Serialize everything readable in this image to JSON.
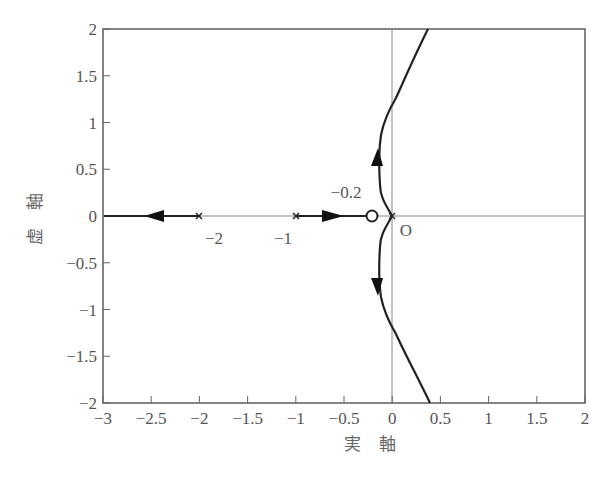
{
  "chart_data": {
    "type": "line",
    "title": "",
    "xlabel": "実 軸",
    "ylabel": "虚 軸",
    "xlim": [
      -3,
      2
    ],
    "ylim": [
      -2,
      2
    ],
    "x_ticks": [
      -3,
      -2.5,
      -2,
      -1.5,
      -1,
      -0.5,
      0,
      0.5,
      1,
      1.5,
      2
    ],
    "x_tick_labels": [
      "−3",
      "−2.5",
      "−2",
      "−1.5",
      "−1",
      "−0.5",
      "0",
      "0.5",
      "1",
      "1.5",
      "2"
    ],
    "y_ticks": [
      2,
      1.5,
      1,
      0.5,
      0,
      -0.5,
      -1,
      -1.5,
      -2
    ],
    "y_tick_labels": [
      "2",
      "1.5",
      "1",
      "0.5",
      "0",
      "−0.5",
      "−1",
      "−1.5",
      "−2"
    ],
    "grid": false,
    "poles": [
      {
        "re": -2,
        "im": 0
      },
      {
        "re": -1,
        "im": 0
      },
      {
        "re": 0,
        "im": 0
      }
    ],
    "zeros": [
      {
        "re": -0.2,
        "im": 0
      }
    ],
    "annotations": [
      {
        "text": "−2",
        "x": -2,
        "y": -0.15
      },
      {
        "text": "−1",
        "x": -1,
        "y": -0.15
      },
      {
        "text": "−0.2",
        "x": -0.3,
        "y": 0.2
      },
      {
        "text": "O",
        "x": 0.08,
        "y": -0.13
      }
    ],
    "series": [
      {
        "name": "branch-real-left",
        "points": [
          [
            -2,
            0
          ],
          [
            -3,
            0
          ]
        ],
        "direction": "toward -inf"
      },
      {
        "name": "branch-real-zero",
        "points": [
          [
            -1,
            0
          ],
          [
            -0.2,
            0
          ]
        ],
        "direction": "toward zero"
      },
      {
        "name": "branch-upper",
        "points": [
          [
            0,
            0
          ],
          [
            -0.08,
            0.2
          ],
          [
            -0.13,
            0.5
          ],
          [
            -0.12,
            0.8
          ],
          [
            -0.05,
            1.0
          ],
          [
            0,
            1.1
          ],
          [
            0.1,
            1.4
          ],
          [
            0.2,
            1.7
          ],
          [
            0.35,
            2.0
          ]
        ],
        "direction": "upward"
      },
      {
        "name": "branch-lower",
        "points": [
          [
            0,
            0
          ],
          [
            -0.08,
            -0.2
          ],
          [
            -0.13,
            -0.5
          ],
          [
            -0.12,
            -0.8
          ],
          [
            -0.05,
            -1.0
          ],
          [
            0,
            -1.15
          ],
          [
            0.1,
            -1.4
          ],
          [
            0.2,
            -1.7
          ],
          [
            0.38,
            -2.0
          ]
        ],
        "direction": "downward"
      }
    ]
  }
}
